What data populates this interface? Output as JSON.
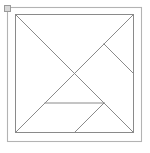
{
  "document": {
    "title": "Tangram",
    "background_color": "#ffffff"
  },
  "selection": {
    "handle_label": "resize-handle",
    "handle_fill": "#d8d8d8",
    "handle_stroke": "#9a9a9a",
    "x": 4,
    "y": 5,
    "size": 7
  },
  "outer_frame": {
    "label": "outer frame",
    "stroke": "#b3b3b3",
    "stroke_width": 1.1,
    "x": 7,
    "y": 7,
    "width": 134,
    "height": 134
  },
  "tangram": {
    "label": "tangram square",
    "stroke": "#8a8a8a",
    "stroke_width": 1,
    "fill": "none",
    "square": {
      "x": 15,
      "y": 14,
      "width": 118,
      "height": 118
    },
    "piece_count": 7,
    "pieces": [
      {
        "name": "large-triangle-lower-left",
        "type": "large triangle",
        "points": "0,0 0,1 0.5,0.5"
      },
      {
        "name": "large-triangle-upper-right",
        "type": "large triangle",
        "points": "0,0 1,0 0.5,0.5"
      },
      {
        "name": "medium-triangle",
        "type": "medium triangle",
        "points": "0,1 0.5,1 0.25,0.75"
      },
      {
        "name": "small-triangle-left",
        "type": "small triangle",
        "points": "0.5,0.5 0.25,0.75 0.5,0.75"
      },
      {
        "name": "square-piece",
        "type": "square",
        "points": "0.5,0.5 0.75,0.25 1,0.5 0.75,0.75"
      },
      {
        "name": "small-triangle-right",
        "type": "small triangle",
        "points": "0.75,0.75 1,0.5 1,1"
      },
      {
        "name": "parallelogram",
        "type": "parallelogram",
        "points": "0.5,0.75 0.75,0.75 1,1 0.5,1"
      }
    ],
    "segments": [
      {
        "name": "square-edge-top",
        "x1": 0,
        "y1": 0,
        "x2": 1,
        "y2": 0
      },
      {
        "name": "square-edge-right",
        "x1": 1,
        "y1": 0,
        "x2": 1,
        "y2": 1
      },
      {
        "name": "square-edge-bottom",
        "x1": 1,
        "y1": 1,
        "x2": 0,
        "y2": 1
      },
      {
        "name": "square-edge-left",
        "x1": 0,
        "y1": 1,
        "x2": 0,
        "y2": 0
      },
      {
        "name": "main-diagonal",
        "x1": 0,
        "y1": 0,
        "x2": 1,
        "y2": 1
      },
      {
        "name": "anti-diagonal-half",
        "x1": 1,
        "y1": 0,
        "x2": 0,
        "y2": 1
      },
      {
        "name": "square-upper-left",
        "x1": 0.5,
        "y1": 0.5,
        "x2": 0.75,
        "y2": 0.25
      },
      {
        "name": "square-upper-right",
        "x1": 0.75,
        "y1": 0.25,
        "x2": 1,
        "y2": 0.5
      },
      {
        "name": "parallelogram-top",
        "x1": 0.25,
        "y1": 0.75,
        "x2": 0.75,
        "y2": 0.75
      },
      {
        "name": "small-triangle-cut",
        "x1": 0.5,
        "y1": 1,
        "x2": 0.75,
        "y2": 0.75
      }
    ]
  }
}
